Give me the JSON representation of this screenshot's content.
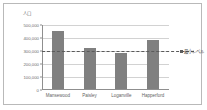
{
  "chart_data": {
    "type": "bar",
    "title": "",
    "subtitle": "",
    "xlabel": "",
    "ylabel": "人口",
    "categories": [
      "Mansewood",
      "Paisley",
      "Loganville",
      "Happerford"
    ],
    "values": [
      450000,
      312000,
      275000,
      380000
    ],
    "series": [
      {
        "name": "人口",
        "values": [
          450000,
          312000,
          275000,
          380000
        ],
        "color": "#808080"
      }
    ],
    "ylim": [
      0,
      500000
    ],
    "ytick_values": [
      500000,
      400000,
      300000,
      200000,
      100000,
      0
    ],
    "ytick_labels": [
      "500,000",
      "400,000",
      "300,000",
      "200,000",
      "100,000",
      "0"
    ],
    "grid": true,
    "grid_axis": "y",
    "legend_position": "none",
    "annotations": [
      {
        "kind": "threshold-line",
        "label": "最小レベル",
        "value": 300000,
        "style": "dashed",
        "color": "#5a5a5a"
      }
    ]
  },
  "colors": {
    "bar": "#808080",
    "grid": "#d2d2d2",
    "axis": "#8f8f8f",
    "threshold": "#5a5a5a",
    "border": "#b9b9b9",
    "background": "#ffffff",
    "tick_text": "#6b6b6b"
  }
}
